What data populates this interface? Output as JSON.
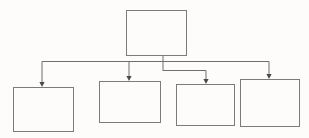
{
  "diagram": {
    "type": "hierarchy-flowchart",
    "title": "",
    "orientation": "top-down",
    "canvas": {
      "width": 309,
      "height": 138,
      "background": "#fdfcfb"
    },
    "style": {
      "box_stroke": "#7b7b7b",
      "box_fill": "#fdfcfb",
      "connector_stroke": "#6f6f6f",
      "arrow_fill": "#4a4a4a",
      "stroke_width": 1
    },
    "nodes": [
      {
        "id": "root",
        "label": "",
        "role": "parent",
        "x": 126,
        "y": 10,
        "width": 60,
        "height": 45
      },
      {
        "id": "child-1",
        "label": "",
        "role": "child",
        "x": 13,
        "y": 87,
        "width": 60,
        "height": 44
      },
      {
        "id": "child-2",
        "label": "",
        "role": "child",
        "x": 99,
        "y": 81,
        "width": 61,
        "height": 41
      },
      {
        "id": "child-3",
        "label": "",
        "role": "child",
        "x": 176,
        "y": 84,
        "width": 58,
        "height": 41
      },
      {
        "id": "child-4",
        "label": "",
        "role": "child",
        "x": 240,
        "y": 79,
        "width": 59,
        "height": 47
      }
    ],
    "connectors": [
      {
        "id": "stem",
        "from": "root",
        "to": "bus",
        "label": "",
        "path": "M 163 55 L 163 71",
        "arrow": false
      },
      {
        "id": "edge-root-child-1",
        "from": "root",
        "to": "child-1",
        "label": "",
        "path": "M 163 61.5 L 42 61.5 L 42 83",
        "arrow": true,
        "arrow_x": 42,
        "arrow_y": 87
      },
      {
        "id": "edge-root-child-2",
        "from": "root",
        "to": "child-2",
        "label": "",
        "path": "M 163 61.5 L 129 61.5 L 129 77",
        "arrow": true,
        "arrow_x": 129,
        "arrow_y": 81
      },
      {
        "id": "edge-root-child-3",
        "from": "root",
        "to": "child-3",
        "label": "",
        "path": "M 163 70.5 L 206 70.5 L 206 80",
        "arrow": true,
        "arrow_x": 206,
        "arrow_y": 84
      },
      {
        "id": "edge-root-child-4",
        "from": "root",
        "to": "child-4",
        "label": "",
        "path": "M 163 61.5 L 269 61.5 L 269 75",
        "arrow": true,
        "arrow_x": 269,
        "arrow_y": 79
      }
    ]
  }
}
